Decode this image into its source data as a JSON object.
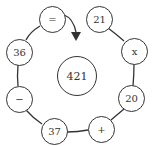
{
  "puzzle": {
    "center": "421",
    "nodes": {
      "equals": "=",
      "n21": "21",
      "times": "x",
      "n36": "36",
      "n20": "20",
      "minus": "−",
      "n37": "37",
      "plus": "+"
    }
  },
  "colors": {
    "stroke": "#333333",
    "background": "#ffffff"
  }
}
